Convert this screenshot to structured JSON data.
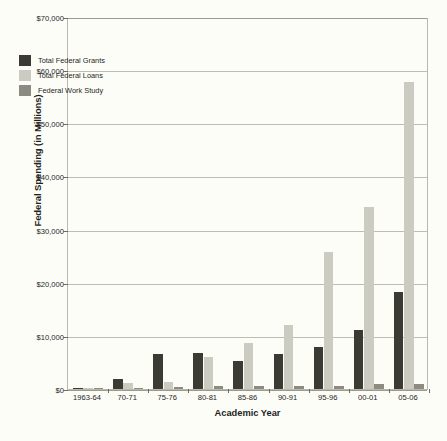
{
  "chart_data": {
    "type": "bar",
    "title": "",
    "xlabel": "Academic Year",
    "ylabel": "Federal Spending (in Millions)",
    "categories": [
      "1963-64",
      "70-71",
      "75-76",
      "80-81",
      "85-86",
      "90-91",
      "95-96",
      "00-01",
      "05-06"
    ],
    "series": [
      {
        "name": "Total Federal Grants",
        "color": "#3b3b34",
        "values": [
          130,
          1800,
          6600,
          6800,
          5200,
          6600,
          8000,
          11100,
          18200
        ]
      },
      {
        "name": "Total Federal Loans",
        "color": "#cbcbc2",
        "values": [
          100,
          1100,
          1400,
          6100,
          8700,
          12100,
          25700,
          34300,
          57700
        ]
      },
      {
        "name": "Federal Work Study",
        "color": "#8b8b81",
        "values": [
          0,
          150,
          300,
          600,
          550,
          600,
          600,
          850,
          950
        ]
      }
    ],
    "ylim": [
      0,
      70000
    ],
    "ytick_values": [
      0,
      10000,
      20000,
      30000,
      40000,
      50000,
      60000,
      70000
    ],
    "ytick_labels": [
      "$0",
      "$10,000",
      "$20,000",
      "$30,000",
      "$40,000",
      "$50,000",
      "$60,000",
      "$70,000"
    ],
    "grid": true,
    "legend_position": "upper-left-inside"
  }
}
